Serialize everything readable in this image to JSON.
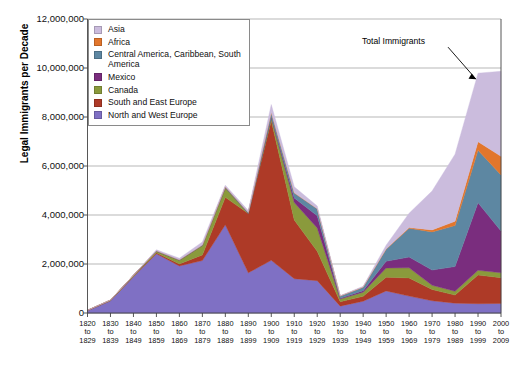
{
  "chart_data": {
    "type": "area",
    "stacked": true,
    "title": "",
    "xlabel": "",
    "ylabel": "Legal Immigrants per Decade",
    "ylim": [
      0,
      12000000
    ],
    "ytick_values": [
      0,
      2000000,
      4000000,
      6000000,
      8000000,
      10000000,
      12000000
    ],
    "ytick_labels": [
      "0",
      "2,000,000",
      "4,000,000",
      "6,000,000",
      "8,000,000",
      "10,000,000",
      "12,000,000"
    ],
    "grid": true,
    "legend_position": "top-left",
    "categories": [
      "1820 to 1829",
      "1830 to 1839",
      "1840 to 1849",
      "1850 to 1859",
      "1860 to 1869",
      "1870 to 1879",
      "1880 to 1889",
      "1890 to 1899",
      "1900 to 1909",
      "1910 to 1919",
      "1920 to 1929",
      "1930 to 1939",
      "1940 to 1949",
      "1950 to 1959",
      "1960 to 1969",
      "1970 to 1979",
      "1980 to 1989",
      "1990 to 1999",
      "2000 to 2009"
    ],
    "xtick_labels": [
      [
        "1820",
        "to",
        "1829"
      ],
      [
        "1830",
        "to",
        "1839"
      ],
      [
        "1840",
        "to",
        "1849"
      ],
      [
        "1850",
        "to",
        "1859"
      ],
      [
        "1860",
        "to",
        "1869"
      ],
      [
        "1870",
        "to",
        "1879"
      ],
      [
        "1880",
        "to",
        "1889"
      ],
      [
        "1890",
        "to",
        "1899"
      ],
      [
        "1900",
        "to",
        "1909"
      ],
      [
        "1910",
        "to",
        "1919"
      ],
      [
        "1920",
        "to",
        "1929"
      ],
      [
        "1930",
        "to",
        "1939"
      ],
      [
        "1940",
        "to",
        "1949"
      ],
      [
        "1950",
        "to",
        "1959"
      ],
      [
        "1960",
        "to",
        "1969"
      ],
      [
        "1970",
        "to",
        "1979"
      ],
      [
        "1980",
        "to",
        "1989"
      ],
      [
        "1990",
        "to",
        "1999"
      ],
      [
        "2000",
        "to",
        "2009"
      ]
    ],
    "series": [
      {
        "name": "North and West Europe",
        "color": "#7f70c4",
        "values": [
          98000,
          496000,
          1480000,
          2420000,
          1920000,
          2140000,
          3600000,
          1640000,
          2150000,
          1400000,
          1320000,
          280000,
          480000,
          900000,
          690000,
          500000,
          400000,
          380000,
          390000
        ]
      },
      {
        "name": "South and East Europe",
        "color": "#ae3a27",
        "values": [
          3000,
          8000,
          12000,
          40000,
          80000,
          230000,
          1120000,
          2420000,
          5700000,
          2400000,
          1200000,
          180000,
          200000,
          560000,
          740000,
          460000,
          330000,
          1170000,
          1050000
        ]
      },
      {
        "name": "Canada",
        "color": "#8a9a3c",
        "values": [
          2000,
          14000,
          42000,
          60000,
          154000,
          384000,
          393000,
          3000,
          123000,
          708000,
          950000,
          109000,
          172000,
          378000,
          413000,
          170000,
          157000,
          192000,
          200000
        ]
      },
      {
        "name": "Mexico",
        "color": "#7a2d7e",
        "values": [
          5000,
          7000,
          3000,
          3000,
          2000,
          5000,
          2000,
          1000,
          32000,
          185000,
          498000,
          32000,
          56000,
          274000,
          441000,
          621000,
          1009000,
          2757000,
          1704000
        ]
      },
      {
        "name": "Central America, Caribbean, South America",
        "color": "#5d87a2",
        "values": [
          4000,
          4000,
          4000,
          16000,
          15000,
          18000,
          32000,
          39000,
          172000,
          203000,
          284000,
          89000,
          144000,
          491000,
          1172000,
          1560000,
          1671000,
          2140000,
          2290000
        ]
      },
      {
        "name": "Africa",
        "color": "#e2762c",
        "values": [
          0,
          0,
          0,
          0,
          0,
          0,
          1000,
          1000,
          7000,
          8000,
          6000,
          2000,
          7000,
          14000,
          29000,
          81000,
          177000,
          355000,
          760000
        ]
      },
      {
        "name": "Asia",
        "color": "#cbbcdd",
        "values": [
          0,
          0,
          0,
          42000,
          65000,
          124000,
          70000,
          75000,
          324000,
          247000,
          112000,
          16000,
          32000,
          150000,
          590000,
          1588000,
          2738000,
          2796000,
          3470000
        ]
      }
    ],
    "annotations": [
      {
        "text": "Total Immigrants",
        "target_category": "1990 to 1999"
      }
    ]
  }
}
